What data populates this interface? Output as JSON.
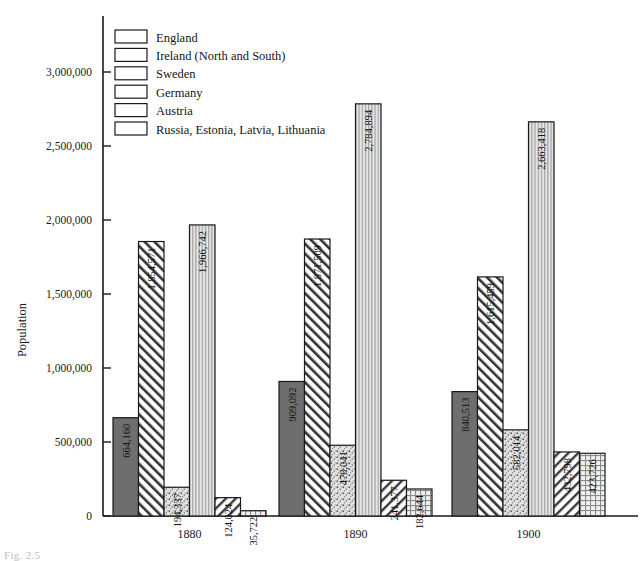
{
  "chart_data": {
    "type": "bar",
    "title": "",
    "subtitle": "",
    "xlabel": "",
    "ylabel": "Population",
    "categories": [
      "1880",
      "1890",
      "1900"
    ],
    "ylim": [
      0,
      3100000
    ],
    "ytick_values": [
      0,
      500000,
      1000000,
      1500000,
      2000000,
      2500000,
      3000000
    ],
    "ytick_labels": [
      "0",
      "500,000",
      "1,000,000",
      "1,500,000",
      "2,000,000",
      "2,500,000",
      "3,000,000"
    ],
    "grid": false,
    "legend_position": "upper-left",
    "series": [
      {
        "name": "England",
        "pattern": "solid-gray",
        "color": "#6e6e6e",
        "values": [
          664160,
          909092,
          840513
        ],
        "labels": [
          "664,160",
          "909,092",
          "840,513"
        ]
      },
      {
        "name": "Ireland (North and South)",
        "pattern": "diagonal-forward",
        "color": "#ffffff",
        "values": [
          1854571,
          1871509,
          1615459
        ],
        "labels": [
          "1,854,571",
          "1,871,509",
          "1,615,459"
        ]
      },
      {
        "name": "Sweden",
        "pattern": "stipple",
        "color": "#dedede",
        "values": [
          194337,
          478041,
          582014
        ],
        "labels": [
          "194,337",
          "478,041",
          "582,014"
        ]
      },
      {
        "name": "Germany",
        "pattern": "vertical-lines",
        "color": "#d8d8d8",
        "values": [
          1966742,
          2784894,
          2663418
        ],
        "labels": [
          "1,966,742",
          "2,784,894",
          "2,663,418"
        ]
      },
      {
        "name": "Austria",
        "pattern": "diagonal-back",
        "color": "#ffffff",
        "values": [
          124024,
          241377,
          432798
        ],
        "labels": [
          "124,024",
          "241,377",
          "432,798"
        ]
      },
      {
        "name": "Russia, Estonia, Latvia, Lithuania",
        "pattern": "crosshatch",
        "color": "#e8e8e8",
        "values": [
          35722,
          182644,
          423726
        ],
        "labels": [
          "35,722",
          "182,644",
          "423,726"
        ]
      }
    ]
  },
  "figure": {
    "caption": "Fig. 2.5"
  }
}
